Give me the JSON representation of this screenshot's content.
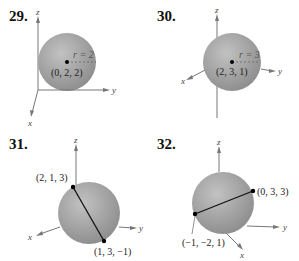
{
  "figure": {
    "problems": [
      {
        "number": "29.",
        "type": "center-radius",
        "center_label": "(0, 2, 2)",
        "radius_label": "r = 2",
        "axes": {
          "x": "x",
          "y": "y",
          "z": "z"
        }
      },
      {
        "number": "30.",
        "type": "center-radius",
        "center_label": "(2, 3, 1)",
        "radius_label": "r = 3",
        "axes": {
          "x": "x",
          "y": "y",
          "z": "z"
        }
      },
      {
        "number": "31.",
        "type": "diameter-endpoints",
        "endpoint_a": "(2, 1, 3)",
        "endpoint_b": "(1, 3, −1)",
        "axes": {
          "x": "x",
          "y": "y",
          "z": "z"
        }
      },
      {
        "number": "32.",
        "type": "diameter-endpoints",
        "endpoint_a": "(0, 3, 3)",
        "endpoint_b": "(−1, −2, 1)",
        "axes": {
          "x": "x",
          "y": "y",
          "z": "z"
        }
      }
    ],
    "colors": {
      "sphere_light": "#b9b9b9",
      "sphere_dark": "#8a8a8a",
      "axis": "#666666",
      "point": "#000000"
    }
  }
}
